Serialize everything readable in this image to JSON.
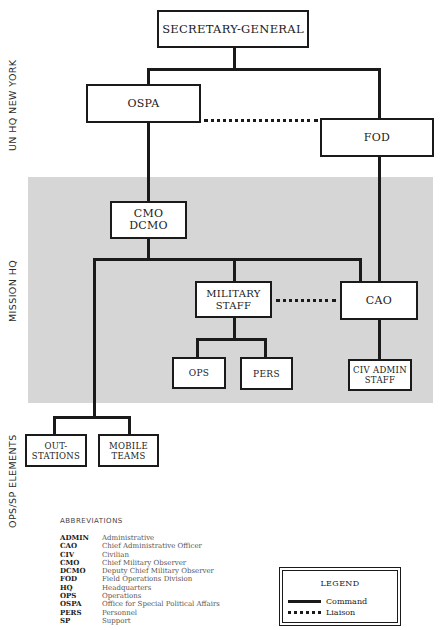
{
  "diagram": {
    "colors": {
      "line": "#1a1a1a",
      "band": "#d6d6d6",
      "box_fill": "#ffffff"
    },
    "zones": [
      {
        "id": "un-hq",
        "label": "UN HQ NEW YORK"
      },
      {
        "id": "mission-hq",
        "label": "MISSION HQ"
      },
      {
        "id": "ops-sp",
        "label": "OPS/SP ELEMENTS"
      }
    ],
    "nodes": {
      "sg": "SECRETARY-GENERAL",
      "ospa": "OSPA",
      "fod": "FOD",
      "cmo": "CMO\nDCMO",
      "military_staff": "MILITARY\nSTAFF",
      "cao": "CAO",
      "ops": "OPS",
      "pers": "PERS",
      "civ_admin": "CIV ADMIN\nSTAFF",
      "outstations": "OUT-\nSTATIONS",
      "mobile_teams": "MOBILE\nTEAMS"
    },
    "edges": [
      {
        "from": "SECRETARY-GENERAL",
        "to": "OSPA",
        "type": "command"
      },
      {
        "from": "SECRETARY-GENERAL",
        "to": "FOD",
        "type": "command"
      },
      {
        "from": "OSPA",
        "to": "FOD",
        "type": "liaison"
      },
      {
        "from": "OSPA",
        "to": "CMO DCMO",
        "type": "command"
      },
      {
        "from": "FOD",
        "to": "CAO",
        "type": "command"
      },
      {
        "from": "CMO DCMO",
        "to": "MILITARY STAFF",
        "type": "command"
      },
      {
        "from": "CMO DCMO",
        "to": "CAO",
        "type": "command"
      },
      {
        "from": "CMO DCMO",
        "to": "OUT-STATIONS",
        "type": "command"
      },
      {
        "from": "CMO DCMO",
        "to": "MOBILE TEAMS",
        "type": "command"
      },
      {
        "from": "MILITARY STAFF",
        "to": "CAO",
        "type": "liaison"
      },
      {
        "from": "MILITARY STAFF",
        "to": "OPS",
        "type": "command"
      },
      {
        "from": "MILITARY STAFF",
        "to": "PERS",
        "type": "command"
      },
      {
        "from": "CAO",
        "to": "CIV ADMIN STAFF",
        "type": "command"
      }
    ]
  },
  "abbreviations": {
    "title": "ABBREVIATIONS",
    "items": [
      {
        "key": "ADMIN",
        "value": "Administrative"
      },
      {
        "key": "CAO",
        "value": "Chief Administrative Officer"
      },
      {
        "key": "CIV",
        "value": "Civilian"
      },
      {
        "key": "CMO",
        "value": "Chief Military Observer"
      },
      {
        "key": "DCMO",
        "value": "Deputy Chief Military Observer"
      },
      {
        "key": "FOD",
        "value": "Field Operations Division"
      },
      {
        "key": "HQ",
        "value": "Headquarters"
      },
      {
        "key": "OPS",
        "value": "Operations"
      },
      {
        "key": "OSPA",
        "value": "Office for Special Political Affairs"
      },
      {
        "key": "PERS",
        "value": "Personnel"
      },
      {
        "key": "SP",
        "value": "Support"
      }
    ]
  },
  "legend": {
    "title": "LEGEND",
    "items": [
      {
        "style": "solid",
        "label": "Command"
      },
      {
        "style": "dotted",
        "label": "Liaison"
      }
    ]
  }
}
